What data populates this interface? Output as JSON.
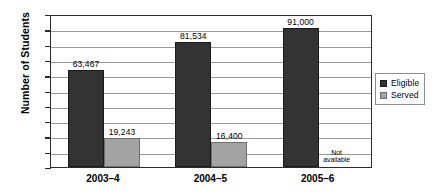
{
  "chart_data": {
    "type": "bar",
    "title": "",
    "subtitle": "",
    "xlabel": "",
    "ylabel": "Number of Students",
    "categories": [
      "2003–4",
      "2004–5",
      "2005–6"
    ],
    "series": [
      {
        "name": "Eligible",
        "color": "#333333",
        "values": [
          63467,
          81534,
          91000
        ],
        "labels": [
          "63,467",
          "81,534",
          "91,000"
        ]
      },
      {
        "name": "Served",
        "color": "#a3a3a3",
        "values": [
          19243,
          16400,
          null
        ],
        "labels": [
          "19,243",
          "16,400",
          ""
        ]
      }
    ],
    "ylim": [
      0,
      100000
    ],
    "y_tick_labels": [],
    "gridlines": 9,
    "grid": true,
    "legend_position": "right",
    "annotations": [
      {
        "text_line1": "Not",
        "text_line2": "available",
        "series": "Served",
        "category": "2005–6"
      }
    ]
  },
  "legend": {
    "items": [
      {
        "label": "Eligible",
        "color": "#333333"
      },
      {
        "label": "Served",
        "color": "#a3a3a3"
      }
    ]
  },
  "axis": {
    "y_title": "Number of Students"
  },
  "colors": {
    "eligible": "#333333",
    "served": "#a3a3a3",
    "frame": "#2b2b2b",
    "gridline": "#9a9a9a",
    "background": "#ffffff"
  }
}
